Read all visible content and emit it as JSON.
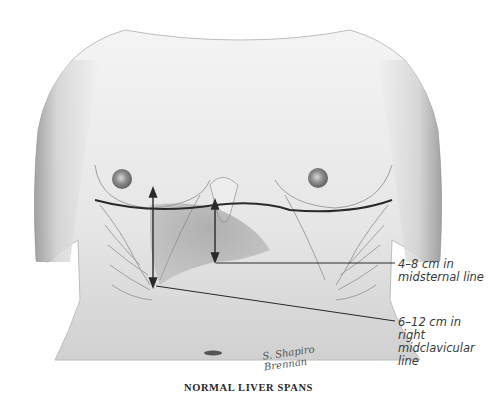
{
  "figure": {
    "title": "NORMAL LIVER SPANS",
    "signature": "S. Shapiro\nBrennan",
    "annotations": [
      {
        "id": "midsternal",
        "text": "4–8 cm in\nmidsternal line",
        "range_cm": [
          4,
          8
        ],
        "line": "midsternal"
      },
      {
        "id": "midclavicular",
        "text": "6–12 cm in\nright\nmidclavicular\nline",
        "range_cm": [
          6,
          12
        ],
        "line": "right midclavicular"
      }
    ],
    "colors": {
      "ink": "#2a2a2a",
      "skin_shadow": "#9a9a9a",
      "background": "#ffffff"
    }
  }
}
